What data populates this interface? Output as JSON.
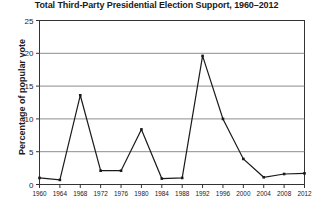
{
  "chart_data": {
    "type": "line",
    "title": "Total Third-Party Presidential Election Support, 1960–2012",
    "xlabel": "",
    "ylabel": "Percentage of popular vote",
    "categories": [
      "1960",
      "1964",
      "1968",
      "1972",
      "1976",
      "1980",
      "1984",
      "1988",
      "1992",
      "1996",
      "2000",
      "2004",
      "2008",
      "2012"
    ],
    "values": [
      1.0,
      0.7,
      13.6,
      2.1,
      2.1,
      8.4,
      0.9,
      1.0,
      19.6,
      10.0,
      3.9,
      1.1,
      1.6,
      1.7
    ],
    "series": [
      {
        "name": "Total third-party support",
        "values": [
          1.0,
          0.7,
          13.6,
          2.1,
          2.1,
          8.4,
          0.9,
          1.0,
          19.6,
          10.0,
          3.9,
          1.1,
          1.6,
          1.7
        ]
      }
    ],
    "ylim": [
      0,
      25
    ],
    "yticks": [
      0,
      5,
      10,
      15,
      20,
      25
    ],
    "ytick_labels": [
      "0",
      "5",
      "10",
      "15",
      "20",
      "25"
    ],
    "grid": true,
    "grid_axis": "y",
    "legend": false,
    "legend_position": "none",
    "marker": "square",
    "line_color": "#1a1a1a",
    "marker_color": "#1a1a1a",
    "grid_color": "#808080",
    "axis_color": "#333333",
    "background_color": "#ffffff"
  }
}
